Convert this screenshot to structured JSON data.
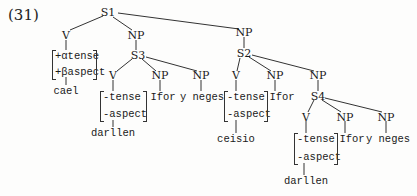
{
  "example_label": "(31)",
  "tree": {
    "nodes": {
      "S1": "S1",
      "V1": "V",
      "NP1": "NP",
      "S3": "S3",
      "V3": "V",
      "NP3a": "NP",
      "NP3b": "NP",
      "NP2top": "NP",
      "S2": "S2",
      "V2": "V",
      "NP2a": "NP",
      "NP2b": "NP",
      "S4": "S4",
      "V4": "V",
      "NP4a": "NP",
      "NP4b": "NP"
    },
    "features": {
      "V1": [
        "+αtense",
        "+βaspect"
      ],
      "V3": [
        "-tense",
        "-aspect"
      ],
      "V2": [
        "-tense",
        "-aspect"
      ],
      "V4": [
        "-tense",
        "-aspect"
      ]
    },
    "words": {
      "V1": "cael",
      "V3": "darllen",
      "NP3a": "Ifor",
      "NP3b": "y neges",
      "V2": "ceisio",
      "NP2a": "Ifor",
      "V4": "darllen",
      "NP4a": "Ifor",
      "NP4b": "y neges"
    }
  }
}
